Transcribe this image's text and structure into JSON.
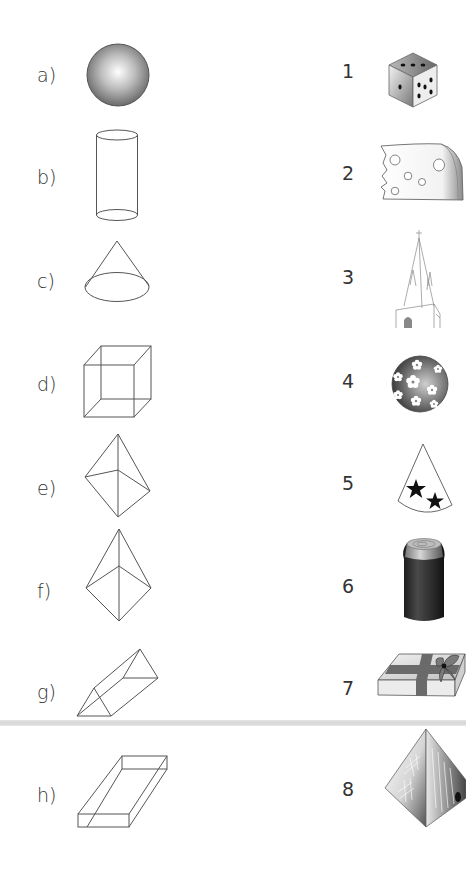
{
  "worksheet": {
    "shapes": [
      {
        "label": "a)",
        "name": "sphere"
      },
      {
        "label": "b)",
        "name": "cylinder"
      },
      {
        "label": "c)",
        "name": "cone"
      },
      {
        "label": "d)",
        "name": "cube"
      },
      {
        "label": "e)",
        "name": "square pyramid"
      },
      {
        "label": "f)",
        "name": "square pyramid"
      },
      {
        "label": "g)",
        "name": "triangular prism"
      },
      {
        "label": "h)",
        "name": "rectangular prism"
      }
    ],
    "objects": [
      {
        "label": "1",
        "name": "dice"
      },
      {
        "label": "2",
        "name": "cheese wedge"
      },
      {
        "label": "3",
        "name": "church spire"
      },
      {
        "label": "4",
        "name": "flower ball"
      },
      {
        "label": "5",
        "name": "party hat with stars"
      },
      {
        "label": "6",
        "name": "drink can"
      },
      {
        "label": "7",
        "name": "gift box with bow"
      },
      {
        "label": "8",
        "name": "pyramid"
      }
    ]
  },
  "colors": {
    "line": "#555555",
    "text": "#333333",
    "scan_band": "#d9d9d9"
  }
}
